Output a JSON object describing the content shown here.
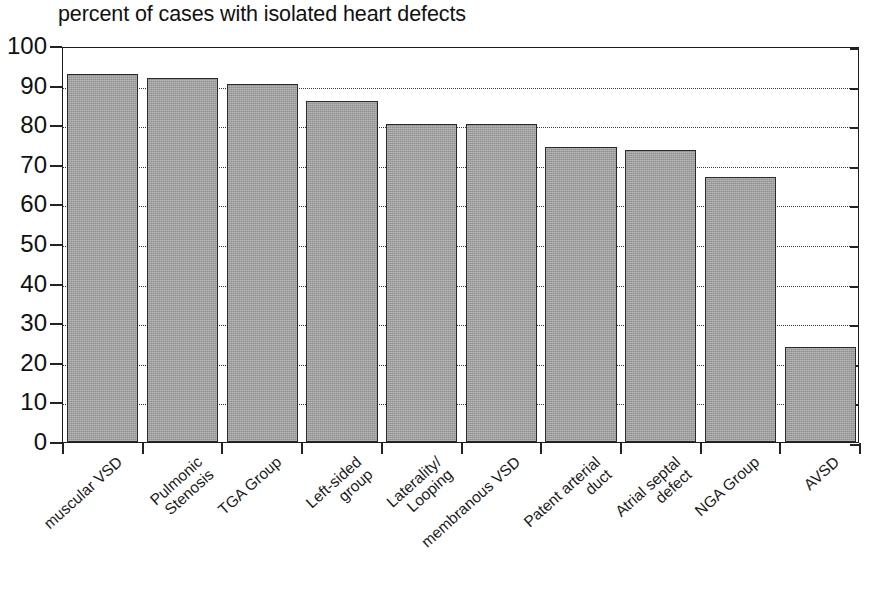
{
  "chart_data": {
    "type": "bar",
    "title": "percent of cases with isolated heart defects",
    "xlabel": "",
    "ylabel": "",
    "ylim": [
      0,
      100
    ],
    "yticks": [
      0,
      10,
      20,
      30,
      40,
      50,
      60,
      70,
      80,
      90,
      100
    ],
    "grid": "horizontal-dotted",
    "legend": "none",
    "categories": [
      "muscular VSD",
      "Pulmonic Stenosis",
      "TGA Group",
      "Left-sided group",
      "Laterality/ Looping",
      "membranous VSD",
      "Patent arterial duct",
      "Atrial septal defect",
      "NGA Group",
      "AVSD"
    ],
    "values": [
      93.0,
      92.0,
      90.3,
      86.0,
      80.3,
      80.3,
      74.5,
      73.8,
      66.8,
      24.0
    ],
    "bar_color": "#9e9e9e",
    "bar_edge_color": "#2a2a2a"
  },
  "axis": {
    "y_tick_labels": [
      "100",
      "90",
      "80",
      "70",
      "60",
      "50",
      "40",
      "30",
      "20",
      "10",
      "0"
    ],
    "x_tick_labels": [
      {
        "line1": "muscular VSD",
        "line2": ""
      },
      {
        "line1": "Pulmonic",
        "line2": "Stenosis"
      },
      {
        "line1": "TGA Group",
        "line2": ""
      },
      {
        "line1": "Left-sided",
        "line2": "group"
      },
      {
        "line1": "Laterality/",
        "line2": "Looping"
      },
      {
        "line1": "membranous VSD",
        "line2": ""
      },
      {
        "line1": "Patent arterial",
        "line2": "duct"
      },
      {
        "line1": "Atrial septal",
        "line2": "defect"
      },
      {
        "line1": "NGA Group",
        "line2": ""
      },
      {
        "line1": "AVSD",
        "line2": ""
      }
    ]
  },
  "caption": {
    "text": ""
  }
}
